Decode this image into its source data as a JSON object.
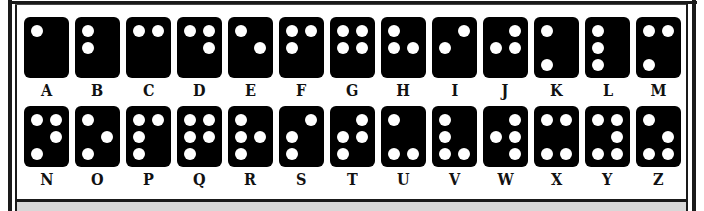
{
  "colors": {
    "card": "#000000",
    "dot": "#ffffff",
    "frame": "#1a1a1a",
    "band": "#d8d8d8"
  },
  "dot_layout": "positions 1-3 left column top to bottom, 4-6 right column top to bottom",
  "rows": [
    {
      "cells": [
        {
          "letter": "A",
          "dots": [
            1
          ]
        },
        {
          "letter": "B",
          "dots": [
            1,
            2
          ]
        },
        {
          "letter": "C",
          "dots": [
            1,
            4
          ]
        },
        {
          "letter": "D",
          "dots": [
            1,
            4,
            5
          ]
        },
        {
          "letter": "E",
          "dots": [
            1,
            5
          ]
        },
        {
          "letter": "F",
          "dots": [
            1,
            2,
            4
          ]
        },
        {
          "letter": "G",
          "dots": [
            1,
            2,
            4,
            5
          ]
        },
        {
          "letter": "H",
          "dots": [
            1,
            2,
            5
          ]
        },
        {
          "letter": "I",
          "dots": [
            2,
            4
          ]
        },
        {
          "letter": "J",
          "dots": [
            2,
            4,
            5
          ]
        },
        {
          "letter": "K",
          "dots": [
            1,
            3
          ]
        },
        {
          "letter": "L",
          "dots": [
            1,
            2,
            3
          ]
        },
        {
          "letter": "M",
          "dots": [
            1,
            3,
            4
          ]
        }
      ]
    },
    {
      "cells": [
        {
          "letter": "N",
          "dots": [
            1,
            3,
            4,
            5
          ]
        },
        {
          "letter": "O",
          "dots": [
            1,
            3,
            5
          ]
        },
        {
          "letter": "P",
          "dots": [
            1,
            2,
            3,
            4
          ]
        },
        {
          "letter": "Q",
          "dots": [
            1,
            2,
            3,
            4,
            5
          ]
        },
        {
          "letter": "R",
          "dots": [
            1,
            2,
            3,
            5
          ]
        },
        {
          "letter": "S",
          "dots": [
            2,
            3,
            4
          ]
        },
        {
          "letter": "T",
          "dots": [
            2,
            3,
            4,
            5
          ]
        },
        {
          "letter": "U",
          "dots": [
            1,
            3,
            6
          ]
        },
        {
          "letter": "V",
          "dots": [
            1,
            2,
            3,
            6
          ]
        },
        {
          "letter": "W",
          "dots": [
            2,
            4,
            5,
            6
          ]
        },
        {
          "letter": "X",
          "dots": [
            1,
            3,
            4,
            6
          ]
        },
        {
          "letter": "Y",
          "dots": [
            1,
            3,
            4,
            5,
            6
          ]
        },
        {
          "letter": "Z",
          "dots": [
            1,
            3,
            5,
            6
          ]
        }
      ]
    }
  ]
}
